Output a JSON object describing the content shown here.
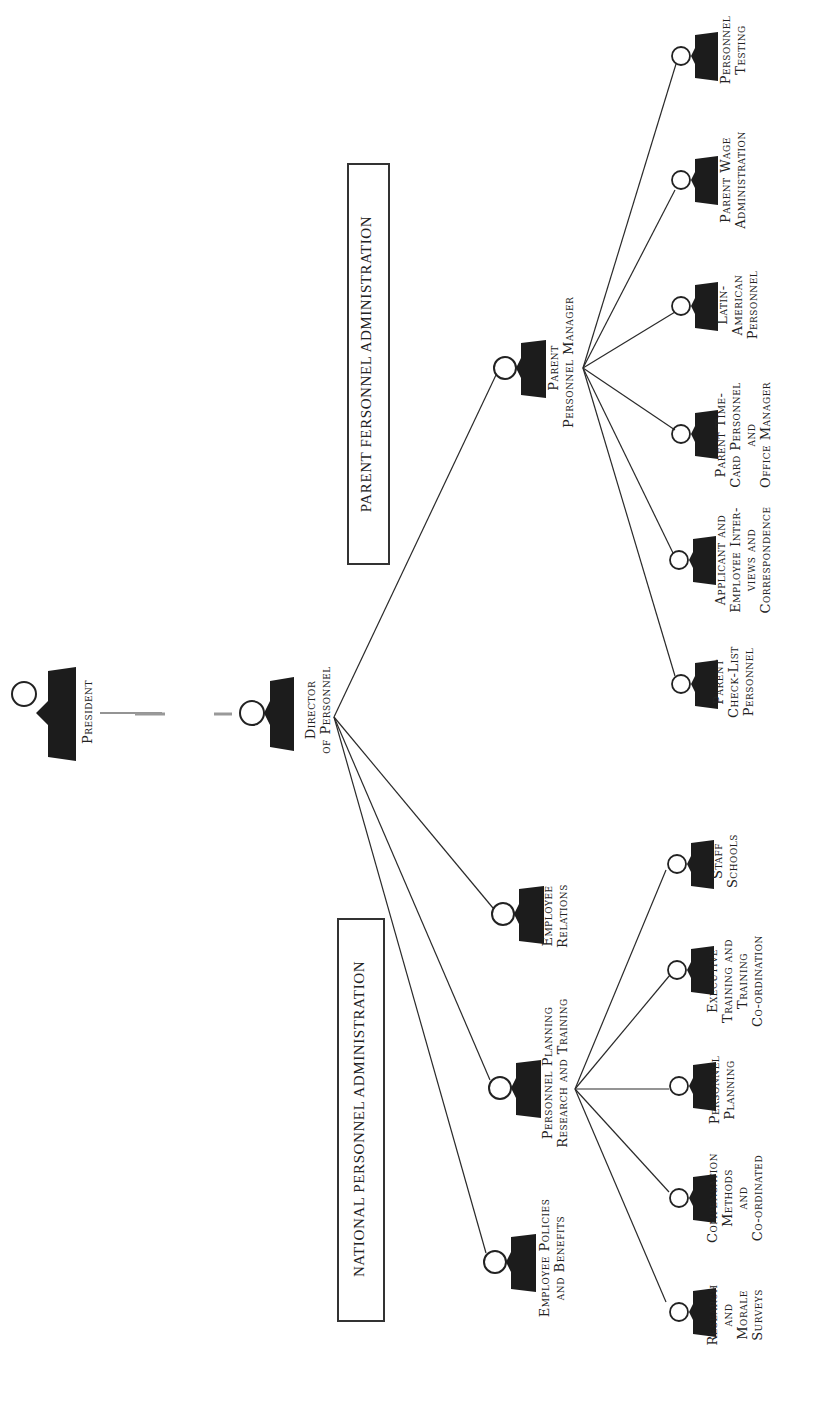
{
  "diagram": {
    "type": "organization-chart",
    "orientation": "rotated-90-ccw",
    "colors": {
      "ink": "#1a1a1a",
      "background": "#ffffff",
      "figure": "#1c1c1c"
    },
    "sections": {
      "parent": {
        "title": "PARENT FERSONNEL ADMINISTRATION"
      },
      "national": {
        "title": "NATIONAL PERSONNEL ADMINISTRATION"
      }
    },
    "nodes": {
      "president": {
        "lines": [
          "President"
        ]
      },
      "director": {
        "lines": [
          "Director",
          "of Personnel"
        ]
      },
      "parent_manager": {
        "lines": [
          "Parent",
          "Personnel Manager"
        ]
      },
      "employee_relations": {
        "lines": [
          "Employee",
          "Relations"
        ]
      },
      "personnel_planning_rt": {
        "lines": [
          "Personnel Planning",
          "Research and Training"
        ]
      },
      "employee_policies": {
        "lines": [
          "Employee Policies",
          "and Benefits"
        ]
      },
      "personnel_testing": {
        "lines": [
          "Personnel",
          "Testing"
        ]
      },
      "wage_admin": {
        "lines": [
          "Parent Wage",
          "Administration"
        ]
      },
      "latin_american": {
        "lines": [
          "Latin-",
          "American",
          "Personnel"
        ]
      },
      "time_card": {
        "lines": [
          "Parent Time-",
          "Card Personnel",
          "and",
          "Office Manager"
        ]
      },
      "applicant": {
        "lines": [
          "Applicant and",
          "Employee Inter-",
          "views and",
          "Correspondence"
        ]
      },
      "check_list": {
        "lines": [
          "Parent",
          "Check-List",
          "Personnel"
        ]
      },
      "staff_schools": {
        "lines": [
          "Staff",
          "Schools"
        ]
      },
      "executive_training": {
        "lines": [
          "Executive",
          "Training and",
          "Training",
          "Co-ordination"
        ]
      },
      "pers_planning": {
        "lines": [
          "Personnel",
          "Planning"
        ]
      },
      "compensation": {
        "lines": [
          "Compensation",
          "Methods",
          "and",
          "Co-ordinated"
        ]
      },
      "research_morale": {
        "lines": [
          "Research",
          "and",
          "Morale",
          "Surveys"
        ]
      }
    },
    "edges": [
      [
        "president",
        "director"
      ],
      [
        "director",
        "parent_manager"
      ],
      [
        "director",
        "employee_relations"
      ],
      [
        "director",
        "personnel_planning_rt"
      ],
      [
        "director",
        "employee_policies"
      ],
      [
        "parent_manager",
        "personnel_testing"
      ],
      [
        "parent_manager",
        "wage_admin"
      ],
      [
        "parent_manager",
        "latin_american"
      ],
      [
        "parent_manager",
        "time_card"
      ],
      [
        "parent_manager",
        "applicant"
      ],
      [
        "parent_manager",
        "check_list"
      ],
      [
        "personnel_planning_rt",
        "staff_schools"
      ],
      [
        "personnel_planning_rt",
        "executive_training"
      ],
      [
        "personnel_planning_rt",
        "pers_planning"
      ],
      [
        "personnel_planning_rt",
        "compensation"
      ],
      [
        "personnel_planning_rt",
        "research_morale"
      ]
    ]
  }
}
